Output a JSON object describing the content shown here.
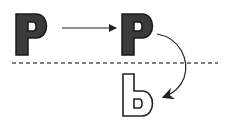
{
  "diagram": {
    "original_letter": "P",
    "translated_letter": "P",
    "reflected_letter": "b",
    "colors": {
      "fill": "#3a3a3a",
      "stroke": "#222222",
      "dashed_line": "#555555",
      "background": "#ffffff"
    }
  }
}
